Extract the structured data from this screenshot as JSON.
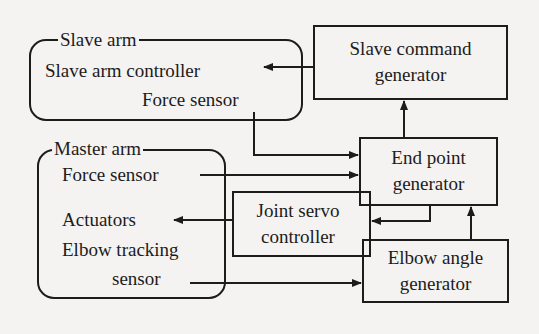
{
  "diagram": {
    "groups": {
      "slave_arm": {
        "title": "Slave arm",
        "items": [
          "Slave arm controller",
          "Force sensor"
        ]
      },
      "master_arm": {
        "title": "Master arm",
        "items": [
          "Force sensor",
          "Actuators",
          "Elbow tracking",
          "sensor"
        ]
      }
    },
    "blocks": {
      "slave_command_generator": [
        "Slave command",
        "generator"
      ],
      "end_point_generator": [
        "End point",
        "generator"
      ],
      "joint_servo_controller": [
        "Joint servo",
        "controller"
      ],
      "elbow_angle_generator": [
        "Elbow angle",
        "generator"
      ]
    },
    "connections": [
      {
        "from": "Slave command generator",
        "to": "Slave arm controller"
      },
      {
        "from": "Slave arm Force sensor",
        "to": "End point generator"
      },
      {
        "from": "Master arm Force sensor",
        "to": "End point generator"
      },
      {
        "from": "End point generator",
        "to": "Slave command generator"
      },
      {
        "from": "End point generator",
        "to": "Joint servo controller"
      },
      {
        "from": "Joint servo controller",
        "to": "Actuators"
      },
      {
        "from": "Elbow tracking sensor",
        "to": "Elbow angle generator"
      },
      {
        "from": "Elbow angle generator",
        "to": "End point generator"
      }
    ],
    "colors": {
      "line": "#1c1c1c",
      "background": "#f4f3f1"
    }
  }
}
